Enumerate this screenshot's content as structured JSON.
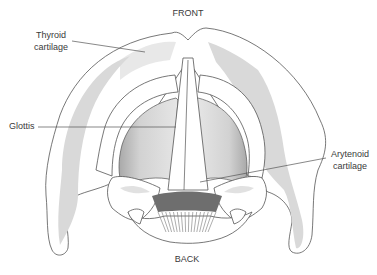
{
  "diagram": {
    "orientation": {
      "top": "FRONT",
      "bottom": "BACK"
    },
    "labels": [
      {
        "id": "thyroid",
        "lines": [
          "Thyroid",
          "cartilage"
        ]
      },
      {
        "id": "glottis",
        "lines": [
          "Glottis"
        ]
      },
      {
        "id": "arytenoid",
        "lines": [
          "Arytenoid",
          "cartilage"
        ]
      }
    ],
    "colors": {
      "outline": "#555555",
      "cartilage_shade": "#d9d9d9",
      "glottis_shade": "#cfcfcf",
      "muscle_dark": "#6e6e6e",
      "background": "#ffffff"
    }
  }
}
